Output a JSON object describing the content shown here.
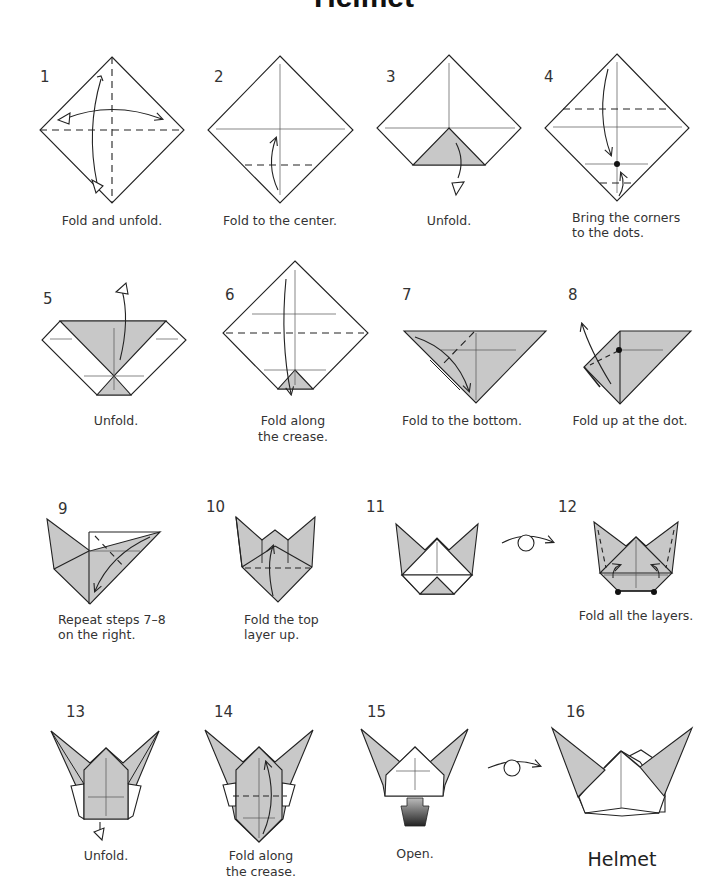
{
  "title": "Helmet",
  "colors": {
    "paper_colored": "#c8c8c8",
    "paper_white": "#ffffff",
    "line": "#222222",
    "background": "#ffffff"
  },
  "steps": [
    {
      "number": "1",
      "caption": [
        "Fold and unfold."
      ]
    },
    {
      "number": "2",
      "caption": [
        "Fold to the center."
      ]
    },
    {
      "number": "3",
      "caption": [
        "Unfold."
      ]
    },
    {
      "number": "4",
      "caption": [
        "Bring the corners",
        "to the dots."
      ]
    },
    {
      "number": "5",
      "caption": [
        "Unfold."
      ]
    },
    {
      "number": "6",
      "caption": [
        "Fold along",
        "the crease."
      ]
    },
    {
      "number": "7",
      "caption": [
        "Fold to the bottom."
      ]
    },
    {
      "number": "8",
      "caption": [
        "Fold up at the dot."
      ]
    },
    {
      "number": "9",
      "caption": [
        "Repeat steps 7–8",
        "on the right."
      ]
    },
    {
      "number": "10",
      "caption": [
        "Fold the top",
        "layer up."
      ]
    },
    {
      "number": "11",
      "caption": []
    },
    {
      "number": "12",
      "caption": [
        "Fold all the layers."
      ]
    },
    {
      "number": "13",
      "caption": [
        "Unfold."
      ]
    },
    {
      "number": "14",
      "caption": [
        "Fold along",
        "the crease."
      ]
    },
    {
      "number": "15",
      "caption": [
        "Open."
      ]
    },
    {
      "number": "16",
      "caption": [
        "Helmet"
      ]
    }
  ],
  "symbols": {
    "turn_over_1": "turn-over-icon",
    "turn_over_2": "turn-over-icon",
    "push_arrow": "push-arrow-icon"
  }
}
